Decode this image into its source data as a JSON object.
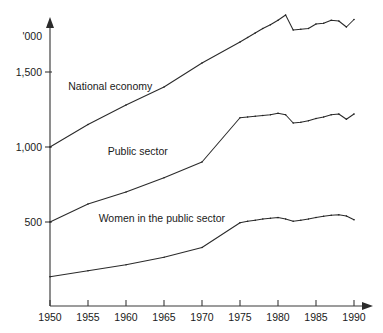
{
  "chart_data": {
    "type": "line",
    "title": "",
    "subtitle": "",
    "xlabel": "",
    "ylabel": "",
    "unit_label": "'000",
    "grid": false,
    "legend_position": "inline-annotations",
    "xlim": [
      1950,
      1990
    ],
    "ylim": [
      0,
      2000
    ],
    "x_tick_labels": [
      "1950",
      "1955",
      "1960",
      "1965",
      "1970",
      "1975",
      "1980",
      "1985",
      "1990"
    ],
    "x_ticks": [
      1950,
      1955,
      1960,
      1965,
      1970,
      1975,
      1980,
      1985,
      1990
    ],
    "y_tick_labels": [
      "500",
      "1,000",
      "1,500"
    ],
    "y_ticks": [
      500,
      1000,
      1500
    ],
    "x": [
      1950,
      1955,
      1960,
      1965,
      1970,
      1975,
      1976,
      1977,
      1978,
      1979,
      1980,
      1981,
      1982,
      1983,
      1984,
      1985,
      1986,
      1987,
      1988,
      1989,
      1990
    ],
    "series": [
      {
        "name": "National economy",
        "values": [
          1000,
          1150,
          1280,
          1400,
          1560,
          1700,
          1730,
          1760,
          1790,
          1815,
          1845,
          1880,
          1780,
          1785,
          1790,
          1820,
          1825,
          1845,
          1840,
          1800,
          1850
        ]
      },
      {
        "name": "Public sector",
        "values": [
          500,
          620,
          700,
          795,
          900,
          1195,
          1200,
          1205,
          1210,
          1215,
          1225,
          1215,
          1160,
          1165,
          1175,
          1190,
          1200,
          1215,
          1220,
          1185,
          1220
        ]
      },
      {
        "name": "Women in the public sector",
        "values": [
          135,
          175,
          215,
          265,
          330,
          495,
          505,
          512,
          520,
          525,
          530,
          520,
          505,
          512,
          520,
          530,
          538,
          545,
          548,
          540,
          515
        ]
      }
    ],
    "annotations": [
      {
        "text": "National economy",
        "x": 1952.4,
        "y": 1380
      },
      {
        "text": "Public sector",
        "x": 1957.6,
        "y": 945
      },
      {
        "text": "Women in the public sector",
        "x": 1956.4,
        "y": 500
      }
    ],
    "colors": {
      "line": "#2a2a2a",
      "axis": "#3a3a3a",
      "text": "#1a1a1a",
      "background": "#ffffff"
    }
  }
}
